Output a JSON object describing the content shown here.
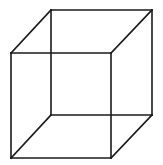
{
  "diagram": {
    "type": "wireframe-cube",
    "stroke_color": "#1a1a1a",
    "background_color": "#ffffff",
    "vertices": {
      "front_top_left": [
        11,
        53
      ],
      "front_top_right": [
        111,
        53
      ],
      "front_bottom_left": [
        11,
        158
      ],
      "front_bottom_right": [
        111,
        158
      ],
      "back_top_left": [
        51,
        10
      ],
      "back_top_right": [
        152,
        10
      ],
      "back_bottom_left": [
        51,
        115
      ],
      "back_bottom_right": [
        152,
        115
      ]
    },
    "edges": [
      {
        "name": "front-top-edge",
        "from": "front_top_left",
        "to": "front_top_right"
      },
      {
        "name": "front-bottom-edge",
        "from": "front_bottom_left",
        "to": "front_bottom_right"
      },
      {
        "name": "front-left-edge",
        "from": "front_top_left",
        "to": "front_bottom_left"
      },
      {
        "name": "front-right-edge",
        "from": "front_top_right",
        "to": "front_bottom_right"
      },
      {
        "name": "back-top-edge",
        "from": "back_top_left",
        "to": "back_top_right"
      },
      {
        "name": "back-bottom-edge",
        "from": "back_bottom_left",
        "to": "back_bottom_right"
      },
      {
        "name": "back-left-edge",
        "from": "back_top_left",
        "to": "back_bottom_left"
      },
      {
        "name": "back-right-edge",
        "from": "back_top_right",
        "to": "back_bottom_right"
      },
      {
        "name": "connector-top-left",
        "from": "front_top_left",
        "to": "back_top_left"
      },
      {
        "name": "connector-top-right",
        "from": "front_top_right",
        "to": "back_top_right"
      },
      {
        "name": "connector-bottom-left",
        "from": "front_bottom_left",
        "to": "back_bottom_left"
      },
      {
        "name": "connector-bottom-right",
        "from": "front_bottom_right",
        "to": "back_bottom_right"
      }
    ]
  }
}
